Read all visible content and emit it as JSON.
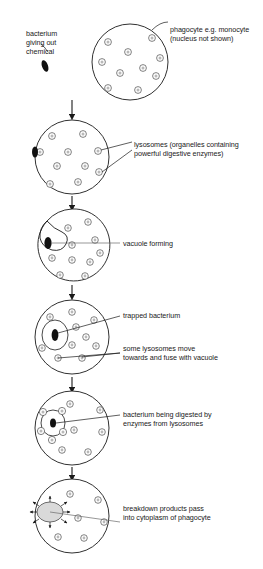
{
  "diagram": {
    "stage_count": 6,
    "ink_color": "#1a1a1a",
    "cell_fill": "#ffffff",
    "bacterium_color": "#111111"
  },
  "labels": {
    "bacterium": "bacterium\ngiving out\nchemical",
    "phagocyte": "phagocyte e.g. monocyte\n(nucleus not shown)",
    "lysosomes": "lysosomes (organelles containing\npowerful digestive enzymes)",
    "vacuole_forming": "vacuole forming",
    "trapped_bacterium": "trapped bacterium",
    "lysosomes_move": "some lysosomes move\ntowards and fuse with vacuole",
    "being_digested": "bacterium being digested by\nenzymes from lysosomes",
    "breakdown": "breakdown products pass\ninto cytoplasm of phagocyte"
  },
  "stages": [
    {
      "name": "stage-1-attraction",
      "cell": {
        "cx": 130,
        "cy": 62,
        "r": 38
      },
      "lysosomes": [
        [
          108,
          42
        ],
        [
          152,
          38
        ],
        [
          128,
          52
        ],
        [
          160,
          58
        ],
        [
          102,
          62
        ],
        [
          143,
          68
        ],
        [
          120,
          73
        ],
        [
          156,
          76
        ],
        [
          108,
          88
        ],
        [
          138,
          90
        ]
      ],
      "bacterium": {
        "x": 45,
        "y": 66,
        "angle": -20
      }
    },
    {
      "name": "stage-2-lysosomes",
      "cell": {
        "cx": 72,
        "cy": 157,
        "r": 37
      },
      "lysosomes": [
        [
          52,
          136
        ],
        [
          83,
          134
        ],
        [
          40,
          152
        ],
        [
          68,
          152
        ],
        [
          98,
          151
        ],
        [
          57,
          166
        ],
        [
          85,
          166
        ],
        [
          99,
          172
        ],
        [
          50,
          184
        ],
        [
          78,
          182
        ]
      ],
      "bacterium": {
        "x": 35,
        "y": 152,
        "angle": 0
      }
    },
    {
      "name": "stage-3-vacuole-forming",
      "cell": {
        "cx": 72,
        "cy": 245,
        "r": 36
      },
      "lysosomes": [
        [
          68,
          228
        ],
        [
          88,
          222
        ],
        [
          95,
          240
        ],
        [
          72,
          245
        ],
        [
          100,
          253
        ],
        [
          52,
          258
        ],
        [
          72,
          260
        ],
        [
          90,
          262
        ],
        [
          60,
          275
        ],
        [
          85,
          276
        ]
      ],
      "bacterium": {
        "x": 48,
        "y": 243,
        "angle": 0
      }
    },
    {
      "name": "stage-4-trapped",
      "cell": {
        "cx": 72,
        "cy": 337,
        "r": 37
      },
      "lysosomes": [
        [
          50,
          317
        ],
        [
          72,
          312
        ],
        [
          94,
          320
        ],
        [
          63,
          327
        ],
        [
          86,
          333
        ],
        [
          72,
          345
        ],
        [
          96,
          346
        ],
        [
          44,
          348
        ],
        [
          58,
          358
        ],
        [
          82,
          358
        ]
      ],
      "bacterium": {
        "x": 55,
        "y": 335,
        "angle": 0
      }
    },
    {
      "name": "stage-5-digesting",
      "cell": {
        "cx": 72,
        "cy": 428,
        "r": 37
      },
      "lysosomes": [
        [
          70,
          404
        ],
        [
          100,
          410
        ],
        [
          72,
          428
        ],
        [
          104,
          432
        ],
        [
          62,
          448
        ],
        [
          88,
          450
        ]
      ],
      "fused_lysosomes": [
        [
          44,
          412
        ],
        [
          62,
          410
        ],
        [
          44,
          432
        ],
        [
          62,
          434
        ],
        [
          54,
          444
        ]
      ],
      "bacterium": {
        "x": 53,
        "y": 423,
        "angle": 0
      }
    },
    {
      "name": "stage-6-breakdown",
      "cell": {
        "cx": 72,
        "cy": 516,
        "r": 37
      },
      "lysosomes": [
        [
          70,
          494
        ],
        [
          98,
          500
        ],
        [
          76,
          516
        ],
        [
          104,
          520
        ],
        [
          58,
          535
        ],
        [
          84,
          536
        ]
      ],
      "vacuole": {
        "cx": 50,
        "cy": 512,
        "rx": 13,
        "ry": 10
      }
    }
  ],
  "arrows": [
    {
      "name": "arrow-1-2",
      "x": 72,
      "y1": 100,
      "y2": 117
    },
    {
      "name": "arrow-2-3",
      "x": 72,
      "y1": 196,
      "y2": 208
    },
    {
      "name": "arrow-3-4",
      "x": 72,
      "y1": 285,
      "y2": 297
    },
    {
      "name": "arrow-4-5",
      "x": 72,
      "y1": 377,
      "y2": 390
    },
    {
      "name": "arrow-5-6",
      "x": 72,
      "y1": 467,
      "y2": 478
    }
  ]
}
